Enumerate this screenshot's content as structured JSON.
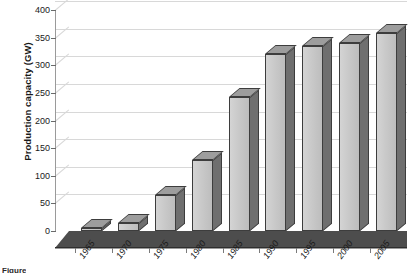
{
  "chart_data": {
    "type": "bar",
    "title": "",
    "xlabel": "",
    "ylabel": "Production capacity (GW)",
    "categories": [
      "1965",
      "1970",
      "1975",
      "1980",
      "1985",
      "1990",
      "1995",
      "2000",
      "2005"
    ],
    "values": [
      5,
      15,
      65,
      128,
      243,
      320,
      335,
      340,
      358
    ],
    "ylim": [
      0,
      400
    ],
    "yticks": [
      0,
      50,
      100,
      150,
      200,
      250,
      300,
      350,
      400
    ],
    "ytick_labels": [
      "0",
      "50",
      "100",
      "150",
      "200",
      "250",
      "300",
      "350",
      "400"
    ],
    "grid": true,
    "legend": "none",
    "style": "3d-column",
    "bar_face_color": "#c9c9c9",
    "bar_side_color": "#6f6f6f",
    "bar_top_color": "#9d9d9d",
    "bar_edge_color": "#3d3d3d",
    "floor_color": "#4d4d4d",
    "gridline_color": "#d8d8d8",
    "background_color": "#ffffff"
  },
  "caption": {
    "text": "Figure"
  }
}
